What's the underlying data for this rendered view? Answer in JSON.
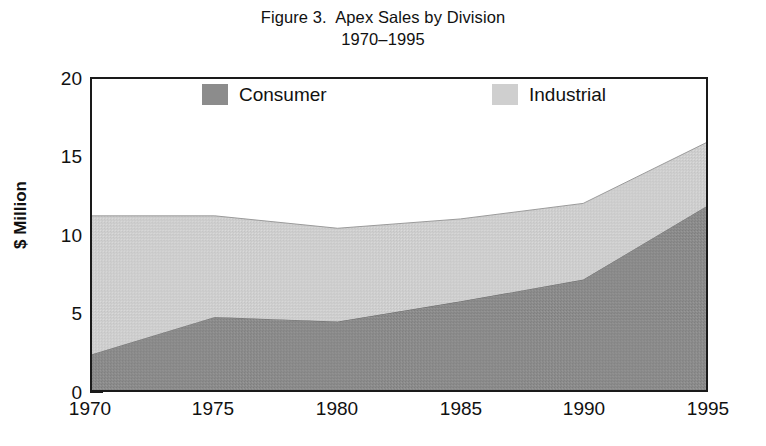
{
  "figure": {
    "title_line1": "Figure 3.  Apex Sales by Division",
    "title_line2": "1970–1995"
  },
  "legend": {
    "position": "top-inside",
    "items": [
      {
        "label": "Consumer",
        "color": "#8c8c8c",
        "icon": "legend-swatch-icon"
      },
      {
        "label": "Industrial",
        "color": "#cfcfcf",
        "icon": "legend-swatch-icon"
      }
    ]
  },
  "axes": {
    "y_title": "$ Million",
    "y_ticks": [
      "0",
      "5",
      "10",
      "15",
      "20"
    ],
    "y_tick_values": [
      0,
      5,
      10,
      15,
      20
    ],
    "y_minor_values": [
      2.5,
      7.5,
      12.5,
      17.5
    ],
    "x_ticks": [
      "1970",
      "1975",
      "1980",
      "1985",
      "1990",
      "1995"
    ],
    "x_tick_values": [
      1970,
      1975,
      1980,
      1985,
      1990,
      1995
    ]
  },
  "chart_data": {
    "type": "area",
    "stacked": true,
    "title": "Figure 3.  Apex Sales by Division 1970–1995",
    "xlabel": "",
    "ylabel": "$ Million",
    "x": [
      1970,
      1975,
      1980,
      1985,
      1990,
      1995
    ],
    "categories": [
      "1970",
      "1975",
      "1980",
      "1985",
      "1990",
      "1995"
    ],
    "series": [
      {
        "name": "Consumer",
        "color": "#8c8c8c",
        "values": [
          2.3,
          4.7,
          4.4,
          5.7,
          7.1,
          11.8
        ]
      },
      {
        "name": "Industrial",
        "color": "#cfcfcf",
        "values": [
          8.9,
          6.5,
          6.0,
          5.3,
          4.9,
          4.1
        ]
      }
    ],
    "totals": [
      11.2,
      11.2,
      10.4,
      11.0,
      12.0,
      15.9
    ],
    "xlim": [
      1970,
      1995
    ],
    "ylim": [
      0,
      20
    ],
    "grid": false,
    "legend_position": "top-inside"
  },
  "colors": {
    "consumer": "#8c8c8c",
    "industrial": "#cfcfcf",
    "frame": "#1a1a1a",
    "background": "#ffffff",
    "text": "#111111"
  }
}
